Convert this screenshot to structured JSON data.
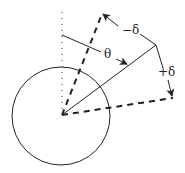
{
  "diagram": {
    "type": "geometry",
    "labels": {
      "theta": "θ",
      "minus_delta": "−δ",
      "plus_delta": "+δ"
    },
    "colors": {
      "stroke": "#222222",
      "background": "#ffffff"
    }
  }
}
